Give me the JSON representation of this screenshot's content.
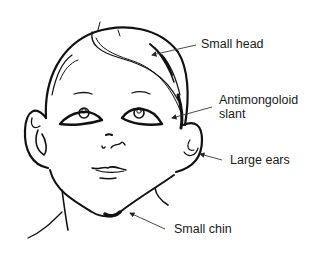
{
  "diagram": {
    "labels": [
      {
        "id": "small-head",
        "text": "Small head"
      },
      {
        "id": "antimongoloid-slant",
        "line1": "Antimongoloid",
        "line2": "slant"
      },
      {
        "id": "large-ears",
        "text": "Large ears"
      },
      {
        "id": "small-chin",
        "text": "Small chin"
      }
    ],
    "colors": {
      "line": "#111111",
      "leader": "#333333",
      "background": "#ffffff"
    }
  }
}
